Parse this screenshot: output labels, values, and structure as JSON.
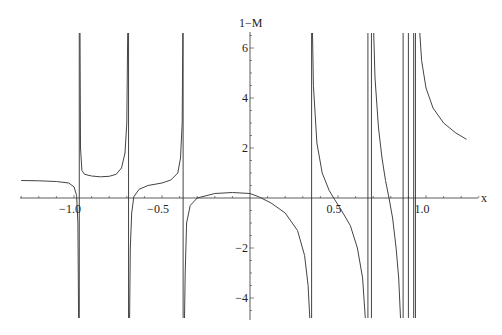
{
  "chart_data": {
    "type": "line",
    "title": "",
    "xlabel": "x",
    "ylabel": "1−M",
    "xlim": [
      -1.32,
      1.3
    ],
    "ylim": [
      -4.9,
      6.7
    ],
    "grid": false,
    "legend": null,
    "x_ticks": [
      {
        "value": -1.0,
        "label": "−1.0"
      },
      {
        "value": -0.5,
        "label": "−0.5"
      },
      {
        "value": 0.5,
        "label": "0.5"
      },
      {
        "value": 1.0,
        "label": "1.0"
      }
    ],
    "y_ticks": [
      {
        "value": -4,
        "label": "−4"
      },
      {
        "value": -2,
        "label": "−2"
      },
      {
        "value": 2,
        "label": "2"
      },
      {
        "value": 4,
        "label": "4"
      },
      {
        "value": 6,
        "label": "6"
      }
    ],
    "vertical_asymptotes": [
      -0.97,
      -0.69,
      -0.38,
      0.35,
      0.67,
      0.69,
      0.87,
      0.9,
      0.93,
      0.94
    ],
    "series": [
      {
        "name": "seg1",
        "points": [
          [
            -1.3,
            0.7
          ],
          [
            -1.2,
            0.69
          ],
          [
            -1.1,
            0.66
          ],
          [
            -1.03,
            0.6
          ],
          [
            -1.0,
            0.45
          ],
          [
            -0.985,
            0.1
          ],
          [
            -0.978,
            -1.0
          ],
          [
            -0.974,
            -4.9
          ]
        ]
      },
      {
        "name": "seg2",
        "points": [
          [
            -0.966,
            6.7
          ],
          [
            -0.963,
            2.0
          ],
          [
            -0.955,
            1.1
          ],
          [
            -0.94,
            0.95
          ],
          [
            -0.9,
            0.88
          ],
          [
            -0.85,
            0.85
          ],
          [
            -0.8,
            0.87
          ],
          [
            -0.76,
            0.95
          ],
          [
            -0.73,
            1.2
          ],
          [
            -0.71,
            1.8
          ],
          [
            -0.7,
            3.0
          ],
          [
            -0.695,
            6.7
          ]
        ]
      },
      {
        "name": "seg3",
        "points": [
          [
            -0.684,
            -4.9
          ],
          [
            -0.68,
            -2.0
          ],
          [
            -0.672,
            -0.6
          ],
          [
            -0.66,
            0.05
          ],
          [
            -0.63,
            0.35
          ],
          [
            -0.58,
            0.5
          ],
          [
            -0.5,
            0.6
          ],
          [
            -0.45,
            0.72
          ],
          [
            -0.41,
            1.0
          ],
          [
            -0.395,
            1.6
          ],
          [
            -0.385,
            3.0
          ],
          [
            -0.382,
            6.7
          ]
        ]
      },
      {
        "name": "seg4",
        "points": [
          [
            -0.372,
            -4.9
          ],
          [
            -0.368,
            -3.0
          ],
          [
            -0.36,
            -1.0
          ],
          [
            -0.34,
            -0.3
          ],
          [
            -0.3,
            0.0
          ],
          [
            -0.2,
            0.18
          ],
          [
            -0.1,
            0.22
          ],
          [
            0.0,
            0.18
          ],
          [
            0.05,
            0.05
          ],
          [
            0.12,
            -0.2
          ],
          [
            0.2,
            -0.6
          ],
          [
            0.27,
            -1.3
          ],
          [
            0.31,
            -2.3
          ],
          [
            0.33,
            -3.5
          ],
          [
            0.34,
            -4.9
          ]
        ]
      },
      {
        "name": "seg5",
        "points": [
          [
            0.355,
            6.7
          ],
          [
            0.36,
            4.5
          ],
          [
            0.38,
            2.2
          ],
          [
            0.41,
            1.0
          ],
          [
            0.45,
            0.3
          ],
          [
            0.48,
            -0.05
          ],
          [
            0.52,
            -0.5
          ],
          [
            0.57,
            -1.1
          ],
          [
            0.61,
            -2.0
          ],
          [
            0.64,
            -3.2
          ],
          [
            0.655,
            -4.9
          ]
        ]
      },
      {
        "name": "seg6",
        "points": [
          [
            0.703,
            6.7
          ],
          [
            0.71,
            4.8
          ],
          [
            0.73,
            2.8
          ],
          [
            0.75,
            1.6
          ],
          [
            0.77,
            0.7
          ],
          [
            0.79,
            0.0
          ],
          [
            0.81,
            -0.8
          ],
          [
            0.83,
            -2.0
          ],
          [
            0.845,
            -3.2
          ],
          [
            0.855,
            -4.9
          ]
        ]
      },
      {
        "name": "seg7",
        "points": [
          [
            0.965,
            6.7
          ],
          [
            0.975,
            5.5
          ],
          [
            1.0,
            4.4
          ],
          [
            1.04,
            3.6
          ],
          [
            1.1,
            3.0
          ],
          [
            1.17,
            2.6
          ],
          [
            1.23,
            2.35
          ]
        ]
      }
    ]
  }
}
